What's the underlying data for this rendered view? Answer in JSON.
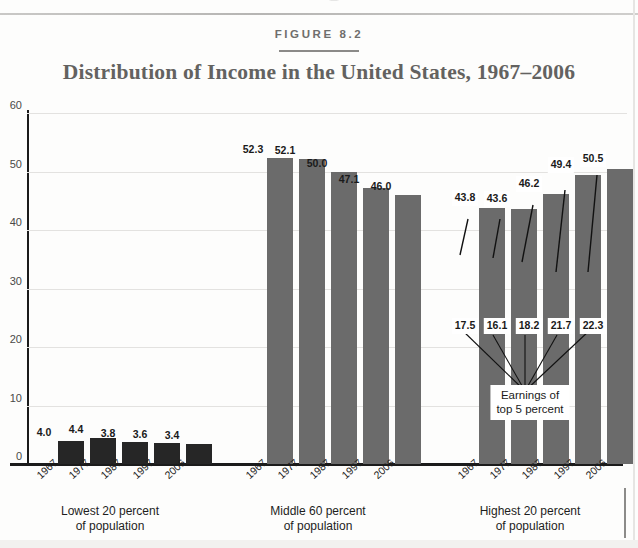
{
  "figure": {
    "label": "FIGURE 8.2",
    "title": "Distribution of Income in the United States, 1967–2006"
  },
  "colors": {
    "bar_fill": "#6b6b6b",
    "bar_fill_dark": "#262626",
    "axis": "#1b1b1b",
    "grid": "#e3e2e0",
    "title_text": "#636260"
  },
  "callout": {
    "line1": "Earnings of",
    "line2": "top 5 percent"
  },
  "chart_data": {
    "type": "bar",
    "title": "Distribution of Income in the United States, 1967–2006",
    "subtitle": "FIGURE 8.2",
    "xlabel": "",
    "ylabel": "",
    "ylim": [
      0,
      60
    ],
    "yticks": [
      0,
      10,
      20,
      30,
      40,
      50,
      60
    ],
    "ytick_labels": [
      "0",
      "10",
      "20",
      "30",
      "40",
      "50",
      "60"
    ],
    "grid": true,
    "legend": "none",
    "categories": [
      "1967",
      "1977",
      "1987",
      "1997",
      "2006"
    ],
    "groups": [
      {
        "name": "Lowest 20 percent of population",
        "caption_line1": "Lowest 20 percent",
        "caption_line2": "of population",
        "values": [
          4.0,
          4.4,
          3.8,
          3.6,
          3.4
        ],
        "labels": [
          "4.0",
          "4.4",
          "3.8",
          "3.6",
          "3.4"
        ]
      },
      {
        "name": "Middle 60 percent of population",
        "caption_line1": "Middle 60 percent",
        "caption_line2": "of population",
        "values": [
          52.3,
          52.1,
          50.0,
          47.1,
          46.0
        ],
        "labels": [
          "52.3",
          "52.1",
          "50.0",
          "47.1",
          "46.0"
        ]
      },
      {
        "name": "Highest 20 percent of population",
        "caption_line1": "Highest 20 percent",
        "caption_line2": "of population",
        "values": [
          43.8,
          43.6,
          46.2,
          49.4,
          50.5
        ],
        "labels": [
          "43.8",
          "43.6",
          "46.2",
          "49.4",
          "50.5"
        ],
        "annotation": "Earnings of top 5 percent",
        "annotation_values": [
          17.5,
          16.1,
          18.2,
          21.7,
          22.3
        ],
        "annotation_labels": [
          "17.5",
          "16.1",
          "18.2",
          "21.7",
          "22.3"
        ]
      }
    ]
  }
}
